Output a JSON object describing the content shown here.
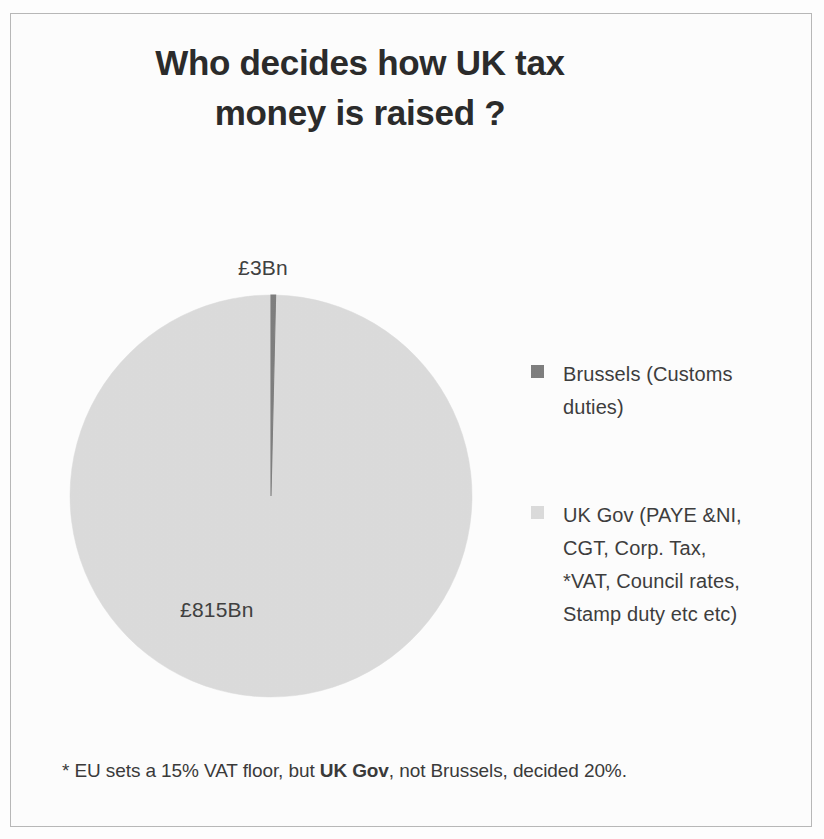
{
  "chart_data": {
    "type": "pie",
    "title": "Who decides how UK tax money is raised ?",
    "title_lines": [
      "Who decides how UK tax",
      "money is raised ?"
    ],
    "categories": [
      "Brussels (Customs duties)",
      "UK Gov (PAYE &NI, CGT, Corp. Tax, *VAT, Council rates, Stamp duty etc etc)"
    ],
    "values": [
      3,
      815
    ],
    "unit": "Bn",
    "currency": "£",
    "data_labels": [
      "£3Bn",
      "£815Bn"
    ],
    "percentages": [
      0.37,
      99.63
    ],
    "colors": [
      "#7f7f7f",
      "#dcdcdc"
    ],
    "legend_position": "right",
    "grid": false,
    "xlabel": "",
    "ylabel": "",
    "annotations": [
      "* EU sets a 15% VAT floor, but UK Gov, not Brussels, decided 20%."
    ]
  },
  "title": {
    "line1": "Who decides how UK tax",
    "line2": "money is raised ?"
  },
  "labels": {
    "brussels": "£3Bn",
    "ukgov": "£815Bn"
  },
  "legend": {
    "items": [
      {
        "color": "#7f7f7f",
        "name": "brussels",
        "lines": [
          "Brussels (Customs",
          "duties)"
        ]
      },
      {
        "color": "#dcdcdc",
        "name": "uk-gov",
        "lines": [
          "UK Gov (PAYE &NI,",
          "CGT, Corp. Tax,",
          "*VAT, Council rates,",
          "Stamp duty etc etc)"
        ]
      }
    ]
  },
  "footnote": {
    "prefix": "* EU sets a 15% VAT floor, but ",
    "emphasis": "UK Gov",
    "suffix": ", not Brussels, decided 20%."
  }
}
